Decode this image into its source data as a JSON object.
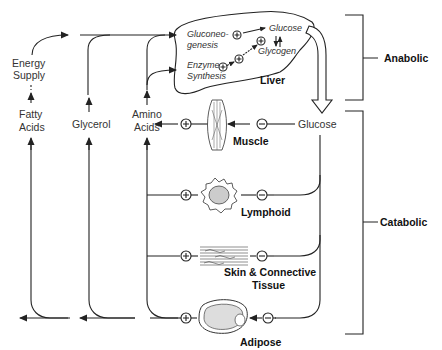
{
  "liver": {
    "label": "Liver",
    "gluconeogenesis_line1": "Gluconeo-",
    "gluconeogenesis_line2": "genesis",
    "enzyme_line1": "Enzyme",
    "enzyme_line2": "Synthesis",
    "glucose": "Glucose",
    "glycogen": "Glycogen"
  },
  "left_nodes": {
    "energy_line1": "Energy",
    "energy_line2": "Supply",
    "fatty_line1": "Fatty",
    "fatty_line2": "Acids",
    "glycerol": "Glycerol",
    "amino_line1": "Amino",
    "amino_line2": "Acids"
  },
  "glucose_node": "Glucose",
  "tissues": {
    "muscle": "Muscle",
    "lymphoid": "Lymphoid",
    "skin_line1": "Skin & Connective",
    "skin_line2": "Tissue",
    "adipose": "Adipose"
  },
  "brackets": {
    "anabolic": "Anabolic",
    "catabolic": "Catabolic"
  },
  "symbols": {
    "plus": "+",
    "minus": "−"
  }
}
